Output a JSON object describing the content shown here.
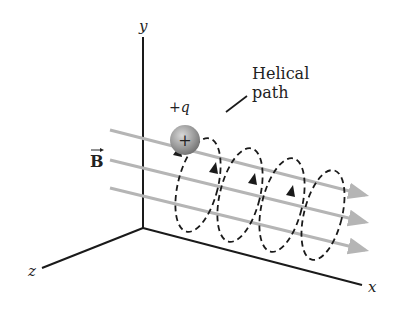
{
  "diagram": {
    "axes": {
      "x_label": "x",
      "y_label": "y",
      "z_label": "z"
    },
    "charge_label": "+q",
    "charge_symbol": "+",
    "field_label": "B",
    "path_label_line1": "Helical",
    "path_label_line2": "path",
    "field_line_count": 3,
    "colors": {
      "field_line": "#b5b5b5",
      "axis": "#1a1a1a",
      "path": "#1a1a1a",
      "charge": "#8e8e8e"
    }
  }
}
